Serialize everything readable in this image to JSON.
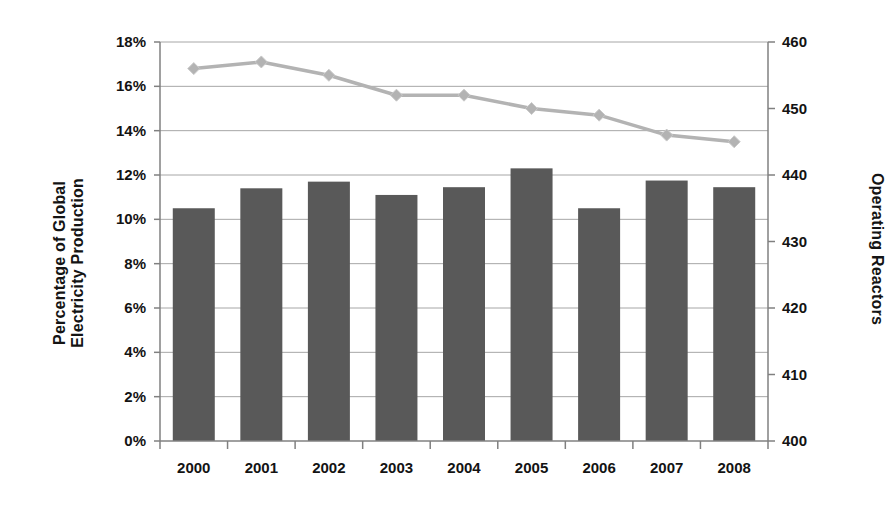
{
  "chart_data": {
    "type": "bar",
    "title": "",
    "categories": [
      "2000",
      "2001",
      "2002",
      "2003",
      "2004",
      "2005",
      "2006",
      "2007",
      "2008"
    ],
    "xlabel": "",
    "grid": true,
    "legend": "none",
    "series": [
      {
        "name": "Percentage of Global Electricity Production",
        "type": "bar",
        "axis": "left",
        "color": "#595959",
        "values": [
          10.5,
          11.4,
          11.7,
          11.1,
          11.45,
          12.3,
          10.5,
          11.75,
          11.45
        ],
        "unit": "%"
      },
      {
        "name": "Operating Reactors",
        "type": "line",
        "axis": "right",
        "color": "#b3b3b3",
        "marker": "diamond",
        "values": [
          456,
          457,
          455,
          452,
          452,
          450,
          449,
          446,
          445
        ],
        "unit": ""
      }
    ],
    "y_left": {
      "label_line1": "Percentage of Global",
      "label_line2": "Electricity Production",
      "ticks": [
        "0%",
        "2%",
        "4%",
        "6%",
        "8%",
        "10%",
        "12%",
        "14%",
        "16%",
        "18%"
      ],
      "tick_values": [
        0,
        2,
        4,
        6,
        8,
        10,
        12,
        14,
        16,
        18
      ],
      "ylim": [
        0,
        18
      ]
    },
    "y_right": {
      "label": "Operating Reactors",
      "ticks": [
        "400",
        "410",
        "420",
        "430",
        "440",
        "450",
        "460"
      ],
      "tick_values": [
        400,
        410,
        420,
        430,
        440,
        450,
        460
      ],
      "ylim": [
        400,
        460
      ]
    }
  },
  "colors": {
    "bar": "#595959",
    "line": "#b3b3b3",
    "grid": "#a6a6a6",
    "axis": "#808080",
    "text": "#131313",
    "background": "#ffffff"
  }
}
